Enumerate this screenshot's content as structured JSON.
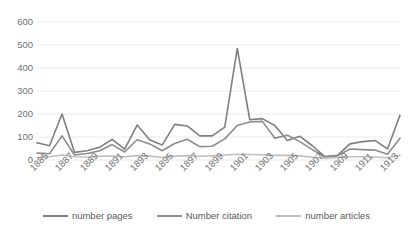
{
  "chart_data": {
    "type": "line",
    "title": "",
    "xlabel": "",
    "ylabel": "",
    "ylim": [
      0,
      600
    ],
    "y_ticks": [
      0,
      100,
      200,
      300,
      400,
      500,
      600
    ],
    "grid": true,
    "legend_position": "bottom",
    "x": [
      1885,
      1886,
      1887,
      1888,
      1889,
      1890,
      1891,
      1892,
      1893,
      1894,
      1895,
      1896,
      1897,
      1898,
      1899,
      1900,
      1901,
      1902,
      1903,
      1904,
      1905,
      1906,
      1907,
      1908,
      1909,
      1910,
      1911,
      1912,
      1913,
      1914
    ],
    "x_tick_labels": [
      "1885",
      "1887",
      "1889",
      "1891",
      "1893",
      "1895",
      "1897",
      "1899",
      "1901",
      "1903",
      "1905",
      "1907",
      "1909",
      "1911",
      "1913"
    ],
    "series": [
      {
        "name": "number pages",
        "color": "#7F7F7F",
        "values": [
          75,
          62,
          200,
          33,
          40,
          55,
          90,
          47,
          152,
          88,
          65,
          155,
          148,
          105,
          105,
          143,
          485,
          175,
          180,
          150,
          85,
          103,
          62,
          15,
          20,
          70,
          80,
          85,
          48,
          195
        ]
      },
      {
        "name": "Number citation",
        "color": "#8C8C8C",
        "values": [
          30,
          27,
          105,
          22,
          28,
          40,
          67,
          35,
          88,
          70,
          40,
          72,
          90,
          58,
          60,
          92,
          150,
          165,
          168,
          95,
          108,
          80,
          45,
          12,
          18,
          48,
          45,
          43,
          25,
          95
        ]
      },
      {
        "name": "number articles",
        "color": "#BFBFBF",
        "values": [
          10,
          14,
          22,
          14,
          13,
          16,
          17,
          14,
          19,
          17,
          11,
          17,
          19,
          16,
          18,
          22,
          25,
          24,
          23,
          20,
          20,
          18,
          12,
          8,
          11,
          14,
          14,
          13,
          10,
          20
        ]
      }
    ]
  },
  "legend": {
    "items": [
      {
        "label": "number pages"
      },
      {
        "label": "Number citation"
      },
      {
        "label": "number articles"
      }
    ]
  },
  "colors": {
    "series_pages": "#7F7F7F",
    "series_citation": "#8C8C8C",
    "series_articles": "#BFBFBF",
    "gridline": "#E8E8E8",
    "tick_text": "#707070",
    "legend_text": "#595959",
    "background": "#FFFFFF"
  }
}
